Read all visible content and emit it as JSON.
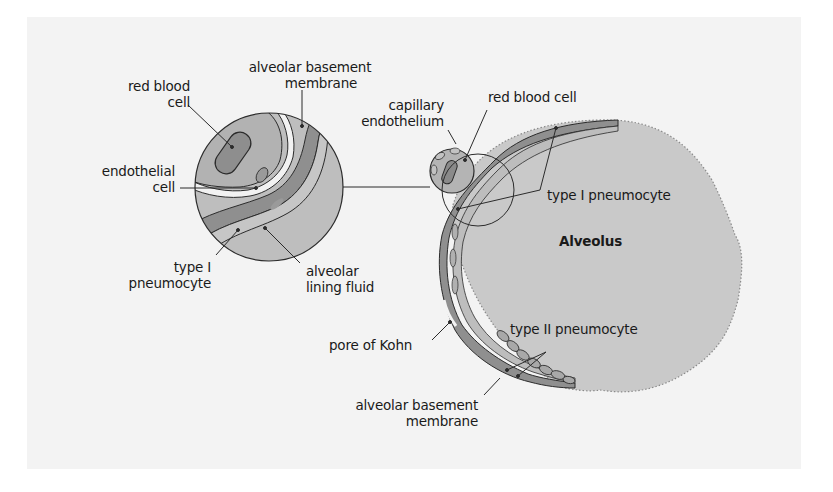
{
  "diagram": {
    "title_region": "Alveolus",
    "colors": {
      "background": "#ffffff",
      "panel": "#f3f3f3",
      "alveolus_fill": "#c9c9c9",
      "tissue_light": "#bdbdbd",
      "tissue_dark": "#8f8f8f",
      "cell_dark": "#7d7d7d",
      "outline": "#2b2b2b"
    },
    "inset_labels": {
      "red_blood_cell": [
        "red blood",
        "cell"
      ],
      "alveolar_basement_membrane": [
        "alveolar basement",
        "membrane"
      ],
      "endothelial_cell": [
        "endothelial",
        "cell"
      ],
      "type_i_pneumocyte": [
        "type I",
        "pneumocyte"
      ],
      "alveolar_lining_fluid": [
        "alveolar",
        "lining fluid"
      ]
    },
    "main_labels": {
      "capillary_endothelium": [
        "capillary",
        "endothelium"
      ],
      "red_blood_cell": "red blood cell",
      "type_i_pneumocyte": "type I pneumocyte",
      "alveolus": "Alveolus",
      "pore_of_kohn": "pore of Kohn",
      "type_ii_pneumocyte": "type II pneumocyte",
      "alveolar_basement_membrane": [
        "alveolar basement",
        "membrane"
      ]
    }
  }
}
